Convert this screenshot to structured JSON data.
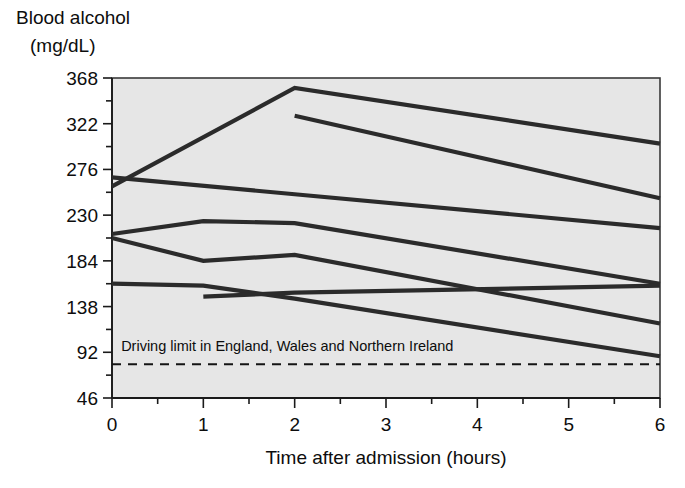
{
  "chart_data": {
    "type": "line",
    "title": "Blood alcohol (mg/dL)",
    "title_line1": "Blood alcohol",
    "title_line2": "(mg/dL)",
    "xlabel": "Time after admission (hours)",
    "ylabel": "Blood alcohol (mg/dL)",
    "xlim": [
      0,
      6
    ],
    "ylim": [
      46,
      368
    ],
    "xticks": [
      0,
      1,
      2,
      3,
      4,
      5,
      6
    ],
    "xtick_labels": [
      "0",
      "1",
      "2",
      "3",
      "4",
      "5",
      "6"
    ],
    "x_minor_ticks": [
      0.5,
      1.5,
      2.5,
      3.5,
      4.5,
      5.5
    ],
    "yticks": [
      46,
      92,
      138,
      184,
      230,
      276,
      322,
      368
    ],
    "ytick_labels": [
      "46",
      "92",
      "138",
      "184",
      "230",
      "276",
      "322",
      "368"
    ],
    "y_minor_ticks": [
      69,
      115,
      161,
      207,
      253,
      299,
      345
    ],
    "grid": false,
    "legend": false,
    "plot_background": "#e6e6e6",
    "line_color": "#2b2b2b",
    "annotations": [
      {
        "text": "Driving limit in England, Wales and Northern Ireland",
        "value": 80,
        "style": "dashed-horizontal-line",
        "label_x": 0.1,
        "label_y": 93
      }
    ],
    "series": [
      {
        "name": "patient-1",
        "x": [
          0,
          2,
          6
        ],
        "values": [
          259,
          358,
          302
        ]
      },
      {
        "name": "patient-2",
        "x": [
          2,
          6
        ],
        "values": [
          330,
          247
        ]
      },
      {
        "name": "patient-3",
        "x": [
          0,
          6
        ],
        "values": [
          268,
          217
        ]
      },
      {
        "name": "patient-4",
        "x": [
          0,
          1,
          2,
          6
        ],
        "values": [
          211,
          224,
          222,
          161
        ]
      },
      {
        "name": "patient-5",
        "x": [
          0,
          1,
          2,
          6
        ],
        "values": [
          207,
          184,
          190,
          121
        ]
      },
      {
        "name": "patient-6",
        "x": [
          0,
          1,
          2,
          6
        ],
        "values": [
          161,
          159,
          146,
          88
        ]
      },
      {
        "name": "patient-7",
        "x": [
          1,
          2,
          6
        ],
        "values": [
          148,
          152,
          159
        ]
      }
    ]
  },
  "figure": {
    "caption": ""
  }
}
